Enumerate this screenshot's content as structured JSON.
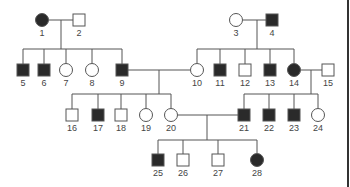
{
  "diagram": {
    "type": "pedigree",
    "colors": {
      "affected": "#2a2a2a",
      "unaffected": "#ffffff",
      "stroke": "#555555",
      "line": "#555555"
    },
    "individuals": [
      {
        "id": "1",
        "sex": "female",
        "affected": true,
        "x": 42,
        "y": 20
      },
      {
        "id": "2",
        "sex": "male",
        "affected": false,
        "x": 79,
        "y": 20
      },
      {
        "id": "3",
        "sex": "female",
        "affected": false,
        "x": 236,
        "y": 20
      },
      {
        "id": "4",
        "sex": "male",
        "affected": true,
        "x": 272,
        "y": 20
      },
      {
        "id": "5",
        "sex": "male",
        "affected": true,
        "x": 23,
        "y": 70
      },
      {
        "id": "6",
        "sex": "male",
        "affected": true,
        "x": 44,
        "y": 70
      },
      {
        "id": "7",
        "sex": "female",
        "affected": false,
        "x": 66,
        "y": 70
      },
      {
        "id": "8",
        "sex": "female",
        "affected": false,
        "x": 92,
        "y": 70
      },
      {
        "id": "9",
        "sex": "male",
        "affected": true,
        "x": 122,
        "y": 70
      },
      {
        "id": "10",
        "sex": "female",
        "affected": false,
        "x": 197,
        "y": 70
      },
      {
        "id": "11",
        "sex": "male",
        "affected": true,
        "x": 220,
        "y": 70
      },
      {
        "id": "12",
        "sex": "male",
        "affected": false,
        "x": 245,
        "y": 70
      },
      {
        "id": "13",
        "sex": "male",
        "affected": true,
        "x": 270,
        "y": 70
      },
      {
        "id": "14",
        "sex": "female",
        "affected": true,
        "x": 294,
        "y": 70
      },
      {
        "id": "15",
        "sex": "male",
        "affected": false,
        "x": 328,
        "y": 70
      },
      {
        "id": "16",
        "sex": "male",
        "affected": false,
        "x": 72,
        "y": 115
      },
      {
        "id": "17",
        "sex": "male",
        "affected": true,
        "x": 98,
        "y": 115
      },
      {
        "id": "18",
        "sex": "male",
        "affected": false,
        "x": 121,
        "y": 115
      },
      {
        "id": "19",
        "sex": "female",
        "affected": false,
        "x": 146,
        "y": 115
      },
      {
        "id": "20",
        "sex": "female",
        "affected": false,
        "x": 171,
        "y": 115
      },
      {
        "id": "21",
        "sex": "male",
        "affected": true,
        "x": 244,
        "y": 115
      },
      {
        "id": "22",
        "sex": "male",
        "affected": true,
        "x": 269,
        "y": 115
      },
      {
        "id": "23",
        "sex": "male",
        "affected": true,
        "x": 294,
        "y": 115
      },
      {
        "id": "24",
        "sex": "female",
        "affected": false,
        "x": 318,
        "y": 115
      },
      {
        "id": "25",
        "sex": "male",
        "affected": true,
        "x": 158,
        "y": 160
      },
      {
        "id": "26",
        "sex": "male",
        "affected": false,
        "x": 183,
        "y": 160
      },
      {
        "id": "27",
        "sex": "male",
        "affected": false,
        "x": 218,
        "y": 160
      },
      {
        "id": "28",
        "sex": "female",
        "affected": true,
        "x": 257,
        "y": 160
      }
    ],
    "matings": [
      {
        "partners": [
          "1",
          "2"
        ]
      },
      {
        "partners": [
          "3",
          "4"
        ]
      },
      {
        "partners": [
          "9",
          "10"
        ]
      },
      {
        "partners": [
          "14",
          "15"
        ]
      },
      {
        "partners": [
          "20",
          "21"
        ]
      }
    ]
  }
}
